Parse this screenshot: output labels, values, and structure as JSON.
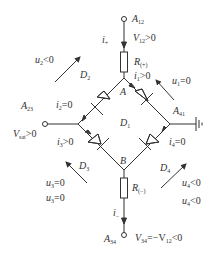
{
  "diagram": {
    "type": "diode bridge circuit",
    "colors": {
      "stroke": "#333333",
      "background": "#ffffff"
    },
    "nodes": {
      "A": {
        "label": "A"
      },
      "B": {
        "label": "B"
      }
    },
    "terminals": {
      "A12": {
        "base": "A",
        "sub": "12"
      },
      "A23": {
        "base": "A",
        "sub": "23"
      },
      "A41": {
        "base": "A",
        "sub": "41"
      },
      "A34": {
        "base": "A",
        "sub": "34"
      }
    },
    "components": {
      "R_plus": {
        "base": "R",
        "sub": "(+)"
      },
      "R_minus": {
        "base": "R",
        "sub": "(−)"
      },
      "D1": {
        "base": "D",
        "sub": "1"
      },
      "D2": {
        "base": "D",
        "sub": "2"
      },
      "D3": {
        "base": "D",
        "sub": "3"
      },
      "D4": {
        "base": "D",
        "sub": "4"
      }
    },
    "currents": {
      "i_plus": {
        "base": "i",
        "sub": "+",
        "rest": ""
      },
      "i_minus": {
        "base": "i",
        "sub": "−",
        "rest": ""
      },
      "i1": {
        "base": "i",
        "sub": "1",
        "rest": ">0"
      },
      "i2": {
        "base": "i",
        "sub": "2",
        "rest": "=0"
      },
      "i3": {
        "base": "i",
        "sub": "3",
        "rest": ">0"
      },
      "i4": {
        "base": "i",
        "sub": "4",
        "rest": "=0"
      }
    },
    "voltages": {
      "V12": {
        "base": "V",
        "sub": "12",
        "rest": ">0"
      },
      "Vsat": {
        "base": "V",
        "sub": "sat",
        "rest": ">0"
      },
      "V34": {
        "base": "V",
        "sub": "34",
        "rest": "=−V",
        "sub2": "12",
        "rest2": "<0"
      },
      "u1": {
        "base": "u",
        "sub": "1",
        "rest": "=0"
      },
      "u2": {
        "base": "u",
        "sub": "2",
        "rest": "<0"
      },
      "u3a": {
        "base": "u",
        "sub": "3",
        "rest": "=0"
      },
      "u3b": {
        "base": "u",
        "sub": "3",
        "rest": "=0"
      },
      "u4a": {
        "base": "u",
        "sub": "4",
        "rest": "<0"
      },
      "u4b": {
        "base": "u",
        "sub": "4",
        "rest": "<0"
      }
    }
  }
}
